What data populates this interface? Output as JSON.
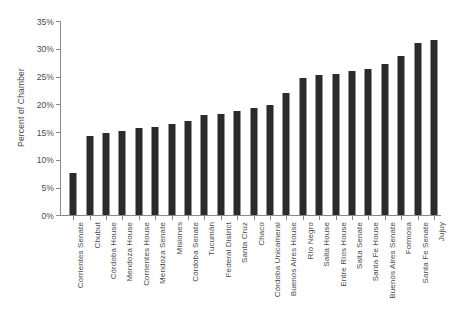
{
  "chart_data": {
    "type": "bar",
    "title": "",
    "xlabel": "",
    "ylabel": "Percent of Chamber",
    "ylim": [
      0,
      35
    ],
    "ytick_labels": [
      "0%",
      "5%",
      "10%",
      "15%",
      "20%",
      "25%",
      "30%",
      "35%"
    ],
    "ytick_values": [
      0,
      5,
      10,
      15,
      20,
      25,
      30,
      35
    ],
    "grid": false,
    "legend": false,
    "bar_color": "#2b2b2b",
    "axis_color": "#8a8a8a",
    "text_color": "#4a4a4a",
    "categories": [
      "Corrientes Senate",
      "Chubut",
      "Córdoba House",
      "Mendoza House",
      "Corrientes House",
      "Mendoza Senate",
      "Misiones",
      "Córdoba Senate",
      "Tucumán",
      "Federal District",
      "Santa Cruz",
      "Chaco",
      "Córdoba Unicameral",
      "Buenos Aires House",
      "Río Negro",
      "Salta House",
      "Entre Ríos House",
      "Salta Senate",
      "Santa Fe House",
      "Buenos Aires Senate",
      "Formosa",
      "Santa Fe Senate",
      "Jujuy"
    ],
    "values": [
      7.6,
      14.3,
      14.8,
      15.2,
      15.7,
      15.8,
      16.4,
      17.0,
      18.1,
      18.2,
      18.7,
      19.3,
      19.8,
      22.1,
      24.8,
      25.3,
      25.5,
      26.0,
      26.4,
      27.3,
      28.7,
      31.0,
      31.6
    ]
  }
}
